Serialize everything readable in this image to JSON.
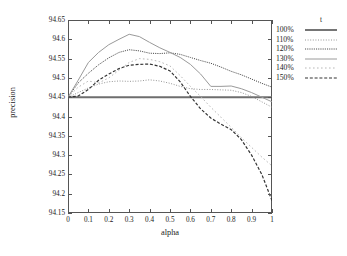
{
  "chart_data": {
    "type": "line",
    "title": "",
    "xlabel": "alpha",
    "ylabel": "precision",
    "xlim": [
      0,
      1
    ],
    "ylim": [
      94.15,
      94.65
    ],
    "xticks": [
      "0",
      "0.1",
      "0.2",
      "0.3",
      "0.4",
      "0.5",
      "0.6",
      "0.7",
      "0.8",
      "0.9",
      "1"
    ],
    "xtick_values": [
      0,
      0.1,
      0.2,
      0.3,
      0.4,
      0.5,
      0.6,
      0.7,
      0.8,
      0.9,
      1
    ],
    "yticks": [
      "94.15",
      "94.2",
      "94.25",
      "94.3",
      "94.35",
      "94.4",
      "94.45",
      "94.5",
      "94.55",
      "94.6",
      "94.65"
    ],
    "ytick_values": [
      94.15,
      94.2,
      94.25,
      94.3,
      94.35,
      94.4,
      94.45,
      94.5,
      94.55,
      94.6,
      94.65
    ],
    "grid": false,
    "legend_title": "t",
    "legend_position": "right-outside",
    "x": [
      0,
      0.05,
      0.1,
      0.15,
      0.2,
      0.25,
      0.3,
      0.35,
      0.4,
      0.45,
      0.5,
      0.55,
      0.6,
      0.65,
      0.7,
      0.75,
      0.8,
      0.85,
      0.9,
      0.95,
      1
    ],
    "series": [
      {
        "name": "100%",
        "style": "solid-thick",
        "color": "#6e6e6e",
        "values": [
          94.45,
          94.45,
          94.45,
          94.45,
          94.45,
          94.45,
          94.45,
          94.45,
          94.45,
          94.45,
          94.45,
          94.45,
          94.45,
          94.45,
          94.45,
          94.45,
          94.45,
          94.45,
          94.45,
          94.45,
          94.45
        ]
      },
      {
        "name": "110%",
        "style": "fine-dotted",
        "color": "#8a8a8a",
        "values": [
          94.45,
          94.462,
          94.474,
          94.484,
          94.49,
          94.492,
          94.491,
          94.492,
          94.495,
          94.492,
          94.486,
          94.478,
          94.472,
          94.47,
          94.47,
          94.469,
          94.468,
          94.462,
          94.452,
          94.438,
          94.424
        ]
      },
      {
        "name": "120%",
        "style": "dense-dotted",
        "color": "#4a4a4a",
        "values": [
          94.45,
          94.487,
          94.512,
          94.534,
          94.552,
          94.566,
          94.573,
          94.57,
          94.564,
          94.563,
          94.565,
          94.561,
          94.553,
          94.545,
          94.538,
          94.528,
          94.517,
          94.508,
          94.497,
          94.486,
          94.476
        ]
      },
      {
        "name": "130%",
        "style": "solid",
        "color": "#9a9a9a",
        "values": [
          94.45,
          94.494,
          94.54,
          94.566,
          94.586,
          94.6,
          94.613,
          94.607,
          94.592,
          94.578,
          94.566,
          94.553,
          94.535,
          94.51,
          94.478,
          94.478,
          94.479,
          94.472,
          94.462,
          94.45,
          94.438
        ]
      },
      {
        "name": "140%",
        "style": "sparse-dotted",
        "color": "#b0b0b0",
        "values": [
          94.45,
          94.476,
          94.492,
          94.487,
          94.5,
          94.52,
          94.54,
          94.55,
          94.548,
          94.542,
          94.531,
          94.506,
          94.478,
          94.452,
          94.424,
          94.398,
          94.372,
          94.345,
          94.32,
          94.295,
          94.272
        ]
      },
      {
        "name": "150%",
        "style": "dashed",
        "color": "#333333",
        "values": [
          94.45,
          94.453,
          94.47,
          94.494,
          94.51,
          94.524,
          94.533,
          94.535,
          94.536,
          94.53,
          94.518,
          94.49,
          94.452,
          94.42,
          94.396,
          94.38,
          94.366,
          94.34,
          94.3,
          94.25,
          94.182
        ]
      }
    ]
  }
}
